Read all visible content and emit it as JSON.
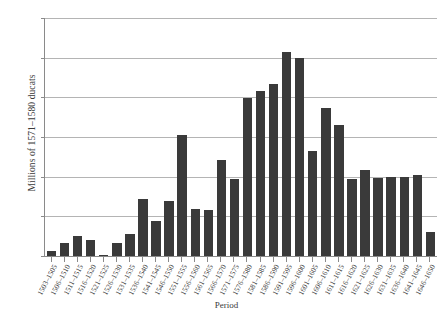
{
  "chart_data": {
    "type": "bar",
    "title": "",
    "xlabel": "Period",
    "ylabel": "Millions of 1571–1580 ducats",
    "ylim": [
      0,
      12
    ],
    "yticks": [
      0,
      2,
      4,
      6,
      8,
      10,
      12
    ],
    "grid": true,
    "legend": "none",
    "bar_color": "#3a3a3a",
    "axis_color": "#8a8a8a",
    "grid_color": "#b4b4b4",
    "categories": [
      "1503–1505",
      "1506–1510",
      "1511–1515",
      "1516–1520",
      "1521–1525",
      "1526–1530",
      "1531–1535",
      "1536–1540",
      "1541–1545",
      "1546–1550",
      "1551–1555",
      "1556–1560",
      "1561–1565",
      "1566–1570",
      "1571–1575",
      "1576–1580",
      "1581–1585",
      "1586–1590",
      "1591–1595",
      "1596–1600",
      "1601–1605",
      "1606–1610",
      "1611–1615",
      "1616–1620",
      "1621–1625",
      "1626–1630",
      "1631–1635",
      "1636–1640",
      "1641–1645",
      "1646–1650"
    ],
    "values": [
      0.25,
      0.65,
      1.0,
      0.8,
      0.05,
      0.65,
      1.1,
      2.85,
      1.75,
      2.75,
      6.1,
      2.35,
      2.3,
      4.85,
      3.9,
      7.95,
      8.3,
      8.65,
      10.3,
      10.0,
      5.3,
      7.45,
      6.6,
      3.9,
      4.35,
      3.95,
      4.0,
      4.0,
      4.1,
      1.2
    ]
  }
}
